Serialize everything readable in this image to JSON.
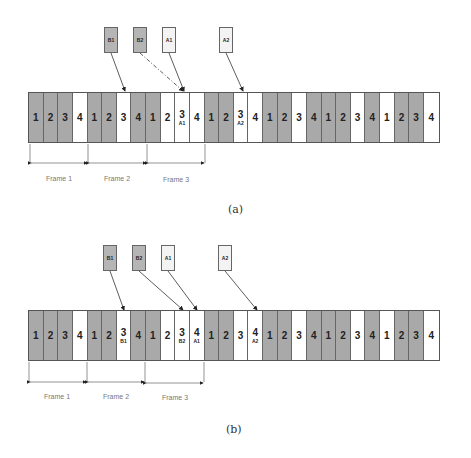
{
  "panels": [
    {
      "id": "a",
      "caption": "(a)",
      "labels": [
        {
          "text": "B1",
          "shade": "gray"
        },
        {
          "text": "B2",
          "shade": "gray"
        },
        {
          "text": "A1",
          "shade": "light"
        },
        {
          "text": "A2",
          "shade": "light"
        }
      ],
      "cells": [
        {
          "n": "1",
          "s": "g"
        },
        {
          "n": "2",
          "s": "g"
        },
        {
          "n": "3",
          "s": "g"
        },
        {
          "n": "4",
          "s": "w"
        },
        {
          "n": "1",
          "s": "g"
        },
        {
          "n": "2",
          "s": "g"
        },
        {
          "n": "3",
          "s": "w"
        },
        {
          "n": "4",
          "s": "g"
        },
        {
          "n": "1",
          "s": "g"
        },
        {
          "n": "2",
          "s": "w"
        },
        {
          "n": "3",
          "s": "w",
          "sub": "A1"
        },
        {
          "n": "4",
          "s": "w"
        },
        {
          "n": "1",
          "s": "g"
        },
        {
          "n": "2",
          "s": "g"
        },
        {
          "n": "3",
          "s": "w",
          "sub": "A2"
        },
        {
          "n": "4",
          "s": "w"
        },
        {
          "n": "1",
          "s": "g"
        },
        {
          "n": "2",
          "s": "g"
        },
        {
          "n": "3",
          "s": "w"
        },
        {
          "n": "4",
          "s": "g"
        },
        {
          "n": "1",
          "s": "g"
        },
        {
          "n": "2",
          "s": "g"
        },
        {
          "n": "3",
          "s": "w"
        },
        {
          "n": "4",
          "s": "g"
        },
        {
          "n": "1",
          "s": "w"
        },
        {
          "n": "2",
          "s": "g"
        },
        {
          "n": "3",
          "s": "g"
        },
        {
          "n": "4",
          "s": "w"
        }
      ],
      "frames": [
        "Frame 1",
        "Frame 2",
        "Frame 3"
      ]
    },
    {
      "id": "b",
      "caption": "(b)",
      "labels": [
        {
          "text": "B1",
          "shade": "gray"
        },
        {
          "text": "B2",
          "shade": "gray"
        },
        {
          "text": "A1",
          "shade": "light"
        },
        {
          "text": "A2",
          "shade": "light"
        }
      ],
      "cells": [
        {
          "n": "1",
          "s": "g"
        },
        {
          "n": "2",
          "s": "g"
        },
        {
          "n": "3",
          "s": "g"
        },
        {
          "n": "4",
          "s": "w"
        },
        {
          "n": "1",
          "s": "g"
        },
        {
          "n": "2",
          "s": "g"
        },
        {
          "n": "3",
          "s": "w",
          "sub": "B1"
        },
        {
          "n": "4",
          "s": "g"
        },
        {
          "n": "1",
          "s": "g"
        },
        {
          "n": "2",
          "s": "w"
        },
        {
          "n": "3",
          "s": "w",
          "sub": "B2"
        },
        {
          "n": "4",
          "s": "w",
          "sub": "A1"
        },
        {
          "n": "1",
          "s": "g"
        },
        {
          "n": "2",
          "s": "g"
        },
        {
          "n": "3",
          "s": "w"
        },
        {
          "n": "4",
          "s": "w",
          "sub": "A2"
        },
        {
          "n": "1",
          "s": "g"
        },
        {
          "n": "2",
          "s": "g"
        },
        {
          "n": "3",
          "s": "w"
        },
        {
          "n": "4",
          "s": "g"
        },
        {
          "n": "1",
          "s": "g"
        },
        {
          "n": "2",
          "s": "g"
        },
        {
          "n": "3",
          "s": "w"
        },
        {
          "n": "4",
          "s": "g"
        },
        {
          "n": "1",
          "s": "w"
        },
        {
          "n": "2",
          "s": "g"
        },
        {
          "n": "3",
          "s": "g"
        },
        {
          "n": "4",
          "s": "w"
        }
      ],
      "frames": [
        "Frame 1",
        "Frame 2",
        "Frame 3"
      ]
    }
  ]
}
